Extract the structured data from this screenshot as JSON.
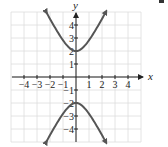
{
  "chart_data": {
    "type": "line",
    "title": "",
    "equation": "y^2/4 - x^2 = 1",
    "xlabel": "x",
    "ylabel": "y",
    "xlim": [
      -5,
      5
    ],
    "ylim": [
      -5,
      5
    ],
    "grid": true,
    "x_ticks": [
      -4,
      -3,
      -2,
      -1,
      1,
      2,
      3,
      4
    ],
    "x_tick_labels": [
      "−4",
      "−3",
      "−2",
      "−1",
      "1",
      "2",
      "3",
      "4"
    ],
    "y_ticks": [
      4,
      3,
      2,
      1,
      -1,
      -2,
      -3,
      -4
    ],
    "y_tick_labels": [
      "4",
      "3",
      "2",
      "1",
      "−1",
      "−2",
      "−3",
      "−4"
    ],
    "series": [
      {
        "name": "upper branch",
        "x": [
          -2.29,
          -2,
          -1.5,
          -1,
          -0.5,
          0,
          0.5,
          1,
          1.5,
          2,
          2.29
        ],
        "y": [
          5.0,
          4.47,
          3.61,
          2.83,
          2.24,
          2.0,
          2.24,
          2.83,
          3.61,
          4.47,
          5.0
        ],
        "arrows": true
      },
      {
        "name": "lower branch",
        "x": [
          -2.29,
          -2,
          -1.5,
          -1,
          -0.5,
          0,
          0.5,
          1,
          1.5,
          2,
          2.29
        ],
        "y": [
          -5.0,
          -4.47,
          -3.61,
          -2.83,
          -2.24,
          -2.0,
          -2.24,
          -2.83,
          -3.61,
          -4.47,
          -5.0
        ],
        "arrows": true
      }
    ],
    "vertices": [
      [
        0,
        2
      ],
      [
        0,
        -2
      ]
    ],
    "colors": {
      "curve": "#555555",
      "grid": "#dddddd",
      "axis": "#222222"
    }
  }
}
